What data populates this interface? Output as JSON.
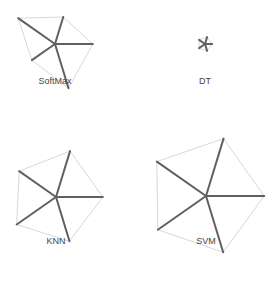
{
  "chart_data": {
    "type": "radar",
    "title": "",
    "axes": [
      "axis-1",
      "axis-2",
      "axis-3",
      "axis-4",
      "axis-5"
    ],
    "range": [
      0,
      1
    ],
    "series": [
      {
        "name": "SoftMax",
        "values": [
          0.47,
          0.63,
          0.77,
          0.47,
          0.75
        ]
      },
      {
        "name": "DT",
        "values": [
          0.12,
          0.12,
          0.12,
          0.12,
          0.12
        ]
      },
      {
        "name": "KNN",
        "values": [
          0.8,
          0.78,
          0.77,
          0.8,
          0.75
        ]
      },
      {
        "name": "SVM",
        "values": [
          1.0,
          0.97,
          0.98,
          0.98,
          1.0
        ]
      }
    ],
    "colors": {
      "spoke": "#606060",
      "outline": "#d8d8d8",
      "label": "#444444"
    }
  }
}
